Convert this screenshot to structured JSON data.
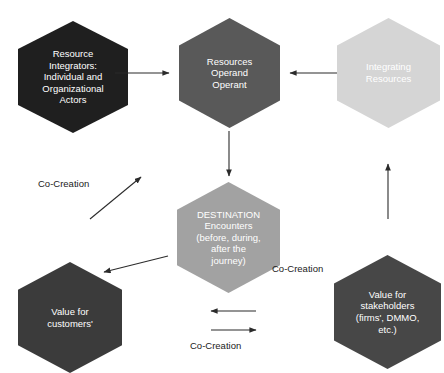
{
  "diagram": {
    "background_color": "#ffffff",
    "arrow_color": "#2b2b2b",
    "nodes": [
      {
        "id": "resource-integrators",
        "label": "Resource\nIntegrators:\nIndividual and\nOrganizational\nActors",
        "fill": "#1f1f1f",
        "text_color": "#ffffff",
        "shape": "hexagon",
        "x": 18,
        "y": 21,
        "w": 110,
        "h": 112,
        "font_size": 9.5
      },
      {
        "id": "resources-operand-operant",
        "label": "Resources\nOperand\nOperant",
        "fill": "#595959",
        "text_color": "#ffffff",
        "shape": "hexagon",
        "x": 179,
        "y": 18,
        "w": 101,
        "h": 110,
        "font_size": 9.5
      },
      {
        "id": "integrating-resources",
        "label": "Integrating\nResources",
        "fill": "#d5d5d5",
        "text_color": "#ffffff",
        "shape": "hexagon",
        "x": 337,
        "y": 18,
        "w": 103,
        "h": 110,
        "font_size": 9.5
      },
      {
        "id": "destination-encounters",
        "label": "DESTINATION\nEncounters\n(before, during,\nafter the\njourney)",
        "fill": "#a2a2a2",
        "text_color": "#ffffff",
        "shape": "hexagon",
        "x": 177,
        "y": 182,
        "w": 103,
        "h": 111,
        "font_size": 9.5
      },
      {
        "id": "value-for-customers",
        "label": "Value for\ncustomers'",
        "fill": "#3b3b3b",
        "text_color": "#ffffff",
        "shape": "hexagon",
        "x": 18,
        "y": 262,
        "w": 104,
        "h": 111,
        "font_size": 9.5
      },
      {
        "id": "value-for-stakeholders",
        "label": "Value for\nstakeholders\n(firms', DMMO,\netc.)",
        "fill": "#474747",
        "text_color": "#ffffff",
        "shape": "hexagon",
        "x": 334,
        "y": 255,
        "w": 107,
        "h": 114,
        "font_size": 9.5
      }
    ],
    "connectors": [
      {
        "id": "arrow-integrators-to-resources",
        "from": "resource-integrators",
        "to": "resources-operand-operant",
        "direction": "right",
        "x1": 115,
        "y1": 73,
        "x2": 169,
        "y2": 73
      },
      {
        "id": "arrow-integrating-to-resources",
        "from": "integrating-resources",
        "to": "resources-operand-operant",
        "direction": "left",
        "x1": 337,
        "y1": 73,
        "x2": 290,
        "y2": 73
      },
      {
        "id": "arrow-resources-to-destination",
        "from": "resources-operand-operant",
        "to": "destination-encounters",
        "direction": "down",
        "x1": 229,
        "y1": 131,
        "x2": 229,
        "y2": 176
      },
      {
        "id": "arrow-stakeholders-to-integrating",
        "from": "value-for-stakeholders",
        "to": "integrating-resources",
        "direction": "up",
        "x1": 388,
        "y1": 219,
        "x2": 388,
        "y2": 164
      },
      {
        "id": "arrow-cocreation-upright",
        "from": "value-for-customers",
        "to": "resources-operand-operant",
        "direction": "up-right",
        "x1": 90,
        "y1": 219,
        "x2": 141,
        "y2": 177
      },
      {
        "id": "arrow-destination-to-customers",
        "from": "destination-encounters",
        "to": "value-for-customers",
        "direction": "down-left",
        "x1": 168,
        "y1": 256,
        "x2": 104,
        "y2": 272
      },
      {
        "id": "arrow-bottom-left",
        "from": "value-for-stakeholders",
        "to": "value-for-customers",
        "direction": "left",
        "x1": 256,
        "y1": 311,
        "x2": 211,
        "y2": 311
      },
      {
        "id": "arrow-bottom-right",
        "from": "value-for-customers",
        "to": "value-for-stakeholders",
        "direction": "right",
        "x1": 211,
        "y1": 330,
        "x2": 256,
        "y2": 330
      }
    ],
    "labels": [
      {
        "id": "co-creation-left",
        "text": "Co-Creation",
        "x": 38,
        "y": 178,
        "font_size": 9.5
      },
      {
        "id": "co-creation-right",
        "text": "Co-Creation",
        "x": 272,
        "y": 263,
        "font_size": 9.5
      },
      {
        "id": "co-creation-bottom",
        "text": "Co-Creation",
        "x": 190,
        "y": 340,
        "font_size": 9.5
      }
    ]
  }
}
